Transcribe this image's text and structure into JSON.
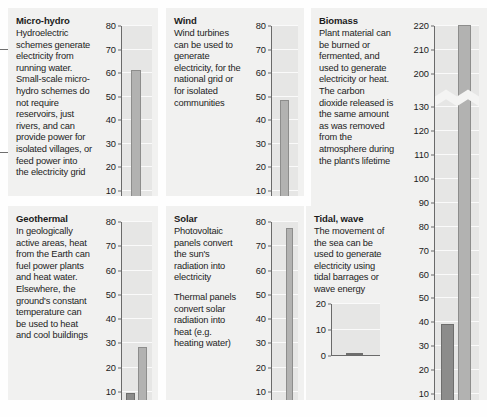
{
  "page": {
    "background": "#fefefe",
    "panel_background": "#f1f1f0",
    "plot_background": "#e6e6e5",
    "bar_light": "#b2b2b1",
    "bar_dark": "#8c8c8b",
    "axis_color": "#6a6a6a"
  },
  "panels": [
    {
      "id": "micro-hydro",
      "title": "Micro-hydro",
      "paragraphs": [
        "Hydroelectric schemes generate electricity from running water. Small-scale micro-hydro schemes do not require reservoirs, just rivers, and can provide power for isolated villages, or feed power into the electricity grid"
      ]
    },
    {
      "id": "wind",
      "title": "Wind",
      "paragraphs": [
        "Wind turbines can be used to generate electricity, for the national grid or for isolated communities"
      ]
    },
    {
      "id": "biomass",
      "title": "Biomass",
      "paragraphs": [
        "Plant material can be burned or fermented, and used to generate electricity or heat. The carbon dioxide released is the same amount as was removed from the atmosphere during the plant's lifetime"
      ]
    },
    {
      "id": "geothermal",
      "title": "Geothermal",
      "paragraphs": [
        "In geologically active areas, heat from the Earth can fuel power plants and heat water. Elsewhere, the ground's constant temperature can be used to heat and cool buildings"
      ]
    },
    {
      "id": "solar",
      "title": "Solar",
      "paragraphs": [
        "Photovoltaic panels convert the sun's radiation into electricity",
        "Thermal panels convert solar radiation into heat (e.g. heating water)"
      ]
    },
    {
      "id": "tidal-wave",
      "title": "Tidal, wave",
      "paragraphs": [
        "The movement of the sea can be used to generate electricity using tidal barrages or wave energy"
      ]
    }
  ],
  "chart_data": [
    {
      "id": "micro-hydro",
      "type": "bar",
      "title": "Micro-hydro",
      "xlabel": "",
      "ylabel": "",
      "ylim": [
        0,
        80
      ],
      "ticks": [
        0,
        10,
        20,
        30,
        40,
        50,
        60,
        70,
        80
      ],
      "grid": true,
      "legend": "none",
      "categories": [
        ""
      ],
      "values": [
        61
      ],
      "bar_styles": [
        "light"
      ]
    },
    {
      "id": "wind",
      "type": "bar",
      "title": "Wind",
      "xlabel": "",
      "ylabel": "",
      "ylim": [
        0,
        80
      ],
      "ticks": [
        0,
        10,
        20,
        30,
        40,
        50,
        60,
        70,
        80
      ],
      "grid": true,
      "legend": "none",
      "categories": [
        ""
      ],
      "values": [
        48
      ],
      "bar_styles": [
        "light"
      ]
    },
    {
      "id": "biomass",
      "type": "bar",
      "title": "Biomass",
      "xlabel": "",
      "ylabel": "",
      "ylim": [
        0,
        220
      ],
      "ticks": [
        0,
        10,
        20,
        30,
        40,
        50,
        60,
        70,
        80,
        90,
        100,
        110,
        120,
        130,
        200,
        210,
        220
      ],
      "axis_break": {
        "from": 130,
        "to": 200
      },
      "grid": true,
      "legend": "none",
      "categories": [
        "",
        ""
      ],
      "values": [
        39,
        220
      ],
      "bar_styles": [
        "dark",
        "light"
      ]
    },
    {
      "id": "geothermal",
      "type": "bar",
      "title": "Geothermal",
      "xlabel": "",
      "ylabel": "",
      "ylim": [
        0,
        80
      ],
      "ticks": [
        0,
        10,
        20,
        30,
        40,
        50,
        60,
        70,
        80
      ],
      "grid": true,
      "legend": "none",
      "categories": [
        "",
        ""
      ],
      "values": [
        9,
        28
      ],
      "bar_styles": [
        "dark",
        "light"
      ]
    },
    {
      "id": "solar",
      "type": "bar",
      "title": "Solar",
      "xlabel": "",
      "ylabel": "",
      "ylim": [
        0,
        80
      ],
      "ticks": [
        0,
        10,
        20,
        30,
        40,
        50,
        60,
        70,
        80
      ],
      "grid": true,
      "legend": "none",
      "categories": [
        "",
        ""
      ],
      "values": [
        4,
        77
      ],
      "bar_styles": [
        "dark",
        "light"
      ]
    },
    {
      "id": "tidal-wave",
      "type": "bar",
      "title": "Tidal, wave",
      "xlabel": "",
      "ylabel": "",
      "ylim": [
        0,
        20
      ],
      "ticks": [
        0,
        10,
        20
      ],
      "grid": true,
      "legend": "none",
      "categories": [
        ""
      ],
      "values": [
        0.5
      ],
      "bar_styles": [
        "dark"
      ]
    }
  ]
}
